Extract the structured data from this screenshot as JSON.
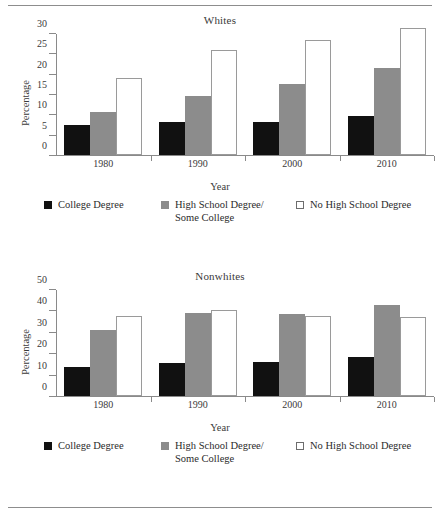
{
  "chart_data": [
    {
      "type": "bar",
      "title": "Whites",
      "xlabel": "Year",
      "ylabel": "Percentage",
      "categories": [
        "1980",
        "1990",
        "2000",
        "2010"
      ],
      "ylim": [
        0,
        30
      ],
      "yticks": [
        0,
        5,
        10,
        15,
        20,
        25,
        30
      ],
      "grid": false,
      "legend_position": "bottom",
      "series": [
        {
          "name": "College Degree",
          "color": "#111111",
          "values": [
            7.5,
            8.0,
            8.2,
            9.6
          ]
        },
        {
          "name": "High School Degree/\nSome College",
          "color": "#8c8c8c",
          "values": [
            10.6,
            14.4,
            17.4,
            21.4
          ]
        },
        {
          "name": "No High School Degree",
          "color": "#ffffff",
          "values": [
            19.0,
            25.8,
            28.2,
            31.2
          ]
        }
      ]
    },
    {
      "type": "bar",
      "title": "Nonwhites",
      "xlabel": "Year",
      "ylabel": "Percentage",
      "categories": [
        "1980",
        "1990",
        "2000",
        "2010"
      ],
      "ylim": [
        0,
        50
      ],
      "yticks": [
        0,
        10,
        20,
        30,
        40,
        50
      ],
      "grid": false,
      "legend_position": "bottom",
      "series": [
        {
          "name": "College Degree",
          "color": "#111111",
          "values": [
            13.5,
            15.6,
            16.1,
            18.4
          ]
        },
        {
          "name": "High School Degree/\nSome College",
          "color": "#8c8c8c",
          "values": [
            30.8,
            38.9,
            38.2,
            42.7
          ]
        },
        {
          "name": "No High School Degree",
          "color": "#ffffff",
          "values": [
            37.6,
            40.4,
            37.6,
            36.8
          ]
        }
      ]
    }
  ],
  "panels": [
    {
      "title": "Whites",
      "ylabel": "Percentage",
      "xlabel": "Year",
      "yticks": [
        "30",
        "25",
        "20",
        "15",
        "10",
        "5",
        "0"
      ],
      "xticks": [
        "1980",
        "1990",
        "2000",
        "2010"
      ]
    },
    {
      "title": "Nonwhites",
      "ylabel": "Percentage",
      "xlabel": "Year",
      "yticks": [
        "50",
        "40",
        "30",
        "20",
        "10",
        "0"
      ],
      "xticks": [
        "1980",
        "1990",
        "2000",
        "2010"
      ]
    }
  ],
  "legend": {
    "items": [
      {
        "label": "College Degree",
        "marker": "filled-black-square"
      },
      {
        "label": "High School Degree/\nSome College",
        "marker": "filled-gray-square"
      },
      {
        "label": "No High School Degree",
        "marker": "open-square"
      }
    ]
  },
  "colors": {
    "college": "#111111",
    "highschool": "#8c8c8c",
    "nohs": "#ffffff",
    "axis": "#8a8a8a",
    "text": "#2b2b2b",
    "rule": "#8d8d8d"
  }
}
